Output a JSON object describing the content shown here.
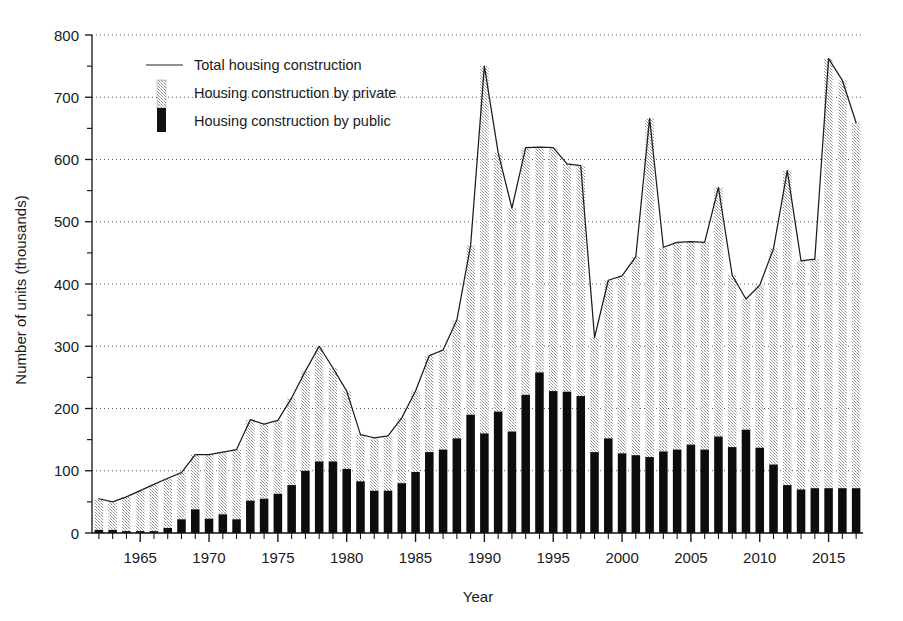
{
  "chart_data": {
    "type": "bar",
    "title": "",
    "subtitle": "",
    "xlabel": "Year",
    "ylabel": "Number of units (thousands)",
    "xlim": [
      1961.5,
      2017.5
    ],
    "ylim": [
      0,
      800
    ],
    "yticks": [
      0,
      100,
      200,
      300,
      400,
      500,
      600,
      700,
      800
    ],
    "ytick_labels": [
      "0",
      "100",
      "200",
      "300",
      "400",
      "500",
      "600",
      "700",
      "800"
    ],
    "yminor_step": 50,
    "xticks": [
      1965,
      1970,
      1975,
      1980,
      1985,
      1990,
      1995,
      2000,
      2005,
      2010,
      2015
    ],
    "xtick_labels": [
      "1965",
      "1970",
      "1975",
      "1980",
      "1985",
      "1990",
      "1995",
      "2000",
      "2005",
      "2010",
      "2015"
    ],
    "grid": "horizontal-dotted-major",
    "legend_position": "upper-left-inside",
    "legend": [
      {
        "key": "total",
        "label": "Total housing construction",
        "marker": "line",
        "color": "#222222"
      },
      {
        "key": "private",
        "label": "Housing construction by private",
        "marker": "swatch",
        "color": "#b4b4b4"
      },
      {
        "key": "public",
        "label": "Housing construction by public",
        "marker": "swatch",
        "color": "#111111"
      }
    ],
    "categories": [
      1962,
      1963,
      1964,
      1965,
      1966,
      1967,
      1968,
      1969,
      1970,
      1971,
      1972,
      1973,
      1974,
      1975,
      1976,
      1977,
      1978,
      1979,
      1980,
      1981,
      1982,
      1983,
      1984,
      1985,
      1986,
      1987,
      1988,
      1989,
      1990,
      1991,
      1992,
      1993,
      1994,
      1995,
      1996,
      1997,
      1998,
      1999,
      2000,
      2001,
      2002,
      2003,
      2004,
      2005,
      2006,
      2007,
      2008,
      2009,
      2010,
      2011,
      2012,
      2013,
      2014,
      2015,
      2016,
      2017
    ],
    "series": [
      {
        "name": "Housing construction by public",
        "values": [
          5,
          5,
          3,
          3,
          3,
          8,
          22,
          38,
          23,
          30,
          22,
          52,
          55,
          63,
          77,
          100,
          115,
          115,
          103,
          83,
          68,
          68,
          80,
          98,
          130,
          134,
          152,
          190,
          160,
          195,
          163,
          222,
          258,
          228,
          227,
          220,
          130,
          152,
          128,
          125,
          122,
          131,
          134,
          142,
          134,
          155,
          138,
          166,
          137,
          110,
          77,
          70,
          72,
          72,
          72,
          72
        ]
      },
      {
        "name": "Housing construction by private",
        "values": [
          50,
          45,
          55,
          65,
          75,
          80,
          75,
          88,
          103,
          100,
          112,
          130,
          120,
          118,
          140,
          160,
          185,
          150,
          125,
          75,
          85,
          88,
          105,
          130,
          155,
          160,
          190,
          272,
          590,
          416,
          359,
          397,
          362,
          391,
          366,
          370,
          184,
          254,
          285,
          319,
          544,
          328,
          333,
          326,
          333,
          400,
          276,
          210,
          261,
          347,
          505,
          367,
          368,
          690,
          655,
          587
        ]
      }
    ],
    "total_series": {
      "name": "Total housing construction",
      "values": [
        55,
        50,
        58,
        68,
        78,
        88,
        97,
        126,
        126,
        130,
        134,
        182,
        175,
        181,
        217,
        260,
        300,
        265,
        228,
        158,
        153,
        156,
        185,
        228,
        285,
        294,
        342,
        462,
        750,
        611,
        522,
        619,
        620,
        619,
        593,
        590,
        314,
        406,
        413,
        444,
        666,
        459,
        467,
        468,
        467,
        555,
        414,
        376,
        398,
        457,
        582,
        437,
        440,
        762,
        727,
        659
      ]
    },
    "notes": {
      "bar_pattern_private": "light grey hatched/stippled",
      "bar_pattern_public": "solid black"
    }
  }
}
